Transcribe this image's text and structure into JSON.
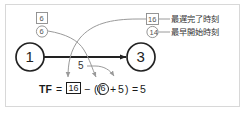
{
  "diagram": {
    "nodes": [
      {
        "id": "node-start",
        "label": "1"
      },
      {
        "id": "node-end",
        "label": "3"
      }
    ],
    "activity": {
      "duration_label": "5"
    },
    "node_annotations": [
      {
        "id": "start-latest-finish",
        "kind": "box",
        "value": "6"
      },
      {
        "id": "start-earliest-start",
        "kind": "circle",
        "value": "6"
      },
      {
        "id": "end-latest-finish",
        "kind": "box",
        "value": "16"
      },
      {
        "id": "end-earliest-start",
        "kind": "circle",
        "value": "14"
      }
    ],
    "legend": [
      {
        "marker_kind": "box",
        "marker_value": "16",
        "label": "最遅完了時刻"
      },
      {
        "marker_kind": "circle",
        "marker_value": "14",
        "label": "最早開始時刻"
      }
    ],
    "formula": {
      "name": "TF",
      "equals": "=",
      "latest_finish": "16",
      "minus": "−",
      "open_paren": "(",
      "open_paren2": "(",
      "earliest_start": "6",
      "close_paren_circle": ")",
      "plus": "+",
      "duration": "5",
      "close_paren": ")",
      "equals2": "=",
      "result": "5"
    },
    "colors": {
      "frame": "#d8d8d8",
      "node_stroke": "#222222",
      "arrow": "#222222",
      "annotation_stroke": "#8a8a8a",
      "leader_line": "#9a9a9a",
      "text": "#1a1a1a",
      "background": "#ffffff"
    }
  }
}
